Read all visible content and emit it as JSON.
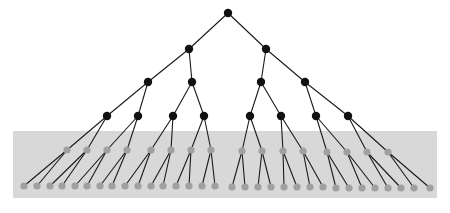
{
  "figure": {
    "type": "diagram",
    "width": 450,
    "height": 213,
    "background_color": "#ffffff"
  },
  "style": {
    "internal_node_color": "#111111",
    "leaf_node_color": "#a0a0a0",
    "edge_color": "#1a1a1a",
    "band_color": "#d8d8d8",
    "node_radius_internal": 4.2,
    "node_radius_leaf": 3.6,
    "edge_width": 1.1
  },
  "band": {
    "label": "highlight-band",
    "x": 13,
    "y": 131,
    "width": 424,
    "height": 67,
    "color": "#d8d8d8"
  },
  "tree": {
    "levels": 6,
    "branching_factor": 2,
    "level_counts": [
      1,
      2,
      4,
      8,
      16,
      32
    ],
    "level_y": [
      13,
      49,
      82,
      116,
      151,
      186
    ],
    "level_node_kind": [
      "internal",
      "internal",
      "internal",
      "internal",
      "leaf",
      "leaf"
    ],
    "nodes": [
      {
        "id": "n0-0",
        "level": 0,
        "index": 0,
        "x": 228,
        "y": 13,
        "kind": "internal",
        "parent": null
      },
      {
        "id": "n1-0",
        "level": 1,
        "index": 0,
        "x": 189,
        "y": 49,
        "kind": "internal",
        "parent": "n0-0"
      },
      {
        "id": "n1-1",
        "level": 1,
        "index": 1,
        "x": 266,
        "y": 49,
        "kind": "internal",
        "parent": "n0-0"
      },
      {
        "id": "n2-0",
        "level": 2,
        "index": 0,
        "x": 148,
        "y": 82,
        "kind": "internal",
        "parent": "n1-0"
      },
      {
        "id": "n2-1",
        "level": 2,
        "index": 1,
        "x": 192,
        "y": 82,
        "kind": "internal",
        "parent": "n1-0"
      },
      {
        "id": "n2-2",
        "level": 2,
        "index": 2,
        "x": 261,
        "y": 82,
        "kind": "internal",
        "parent": "n1-1"
      },
      {
        "id": "n2-3",
        "level": 2,
        "index": 3,
        "x": 305,
        "y": 82,
        "kind": "internal",
        "parent": "n1-1"
      },
      {
        "id": "n3-0",
        "level": 3,
        "index": 0,
        "x": 107,
        "y": 116,
        "kind": "internal",
        "parent": "n2-0"
      },
      {
        "id": "n3-1",
        "level": 3,
        "index": 1,
        "x": 138,
        "y": 116,
        "kind": "internal",
        "parent": "n2-0"
      },
      {
        "id": "n3-2",
        "level": 3,
        "index": 2,
        "x": 173,
        "y": 116,
        "kind": "internal",
        "parent": "n2-1"
      },
      {
        "id": "n3-3",
        "level": 3,
        "index": 3,
        "x": 204,
        "y": 116,
        "kind": "internal",
        "parent": "n2-1"
      },
      {
        "id": "n3-4",
        "level": 3,
        "index": 4,
        "x": 250,
        "y": 116,
        "kind": "internal",
        "parent": "n2-2"
      },
      {
        "id": "n3-5",
        "level": 3,
        "index": 5,
        "x": 281,
        "y": 116,
        "kind": "internal",
        "parent": "n2-2"
      },
      {
        "id": "n3-6",
        "level": 3,
        "index": 6,
        "x": 316,
        "y": 116,
        "kind": "internal",
        "parent": "n2-3"
      },
      {
        "id": "n3-7",
        "level": 3,
        "index": 7,
        "x": 348,
        "y": 116,
        "kind": "internal",
        "parent": "n2-3"
      },
      {
        "id": "n4-0",
        "level": 4,
        "index": 0,
        "x": 67,
        "y": 150,
        "kind": "leaf",
        "parent": "n3-0"
      },
      {
        "id": "n4-1",
        "level": 4,
        "index": 1,
        "x": 87,
        "y": 150,
        "kind": "leaf",
        "parent": "n3-0"
      },
      {
        "id": "n4-2",
        "level": 4,
        "index": 2,
        "x": 107,
        "y": 150,
        "kind": "leaf",
        "parent": "n3-1"
      },
      {
        "id": "n4-3",
        "level": 4,
        "index": 3,
        "x": 127,
        "y": 150,
        "kind": "leaf",
        "parent": "n3-1"
      },
      {
        "id": "n4-4",
        "level": 4,
        "index": 4,
        "x": 151,
        "y": 150,
        "kind": "leaf",
        "parent": "n3-2"
      },
      {
        "id": "n4-5",
        "level": 4,
        "index": 5,
        "x": 171,
        "y": 150,
        "kind": "leaf",
        "parent": "n3-2"
      },
      {
        "id": "n4-6",
        "level": 4,
        "index": 6,
        "x": 191,
        "y": 150,
        "kind": "leaf",
        "parent": "n3-3"
      },
      {
        "id": "n4-7",
        "level": 4,
        "index": 7,
        "x": 211,
        "y": 150,
        "kind": "leaf",
        "parent": "n3-3"
      },
      {
        "id": "n4-8",
        "level": 4,
        "index": 8,
        "x": 242,
        "y": 151,
        "kind": "leaf",
        "parent": "n3-4"
      },
      {
        "id": "n4-9",
        "level": 4,
        "index": 9,
        "x": 262,
        "y": 151,
        "kind": "leaf",
        "parent": "n3-4"
      },
      {
        "id": "n4-10",
        "level": 4,
        "index": 10,
        "x": 283,
        "y": 151,
        "kind": "leaf",
        "parent": "n3-5"
      },
      {
        "id": "n4-11",
        "level": 4,
        "index": 11,
        "x": 303,
        "y": 151,
        "kind": "leaf",
        "parent": "n3-5"
      },
      {
        "id": "n4-12",
        "level": 4,
        "index": 12,
        "x": 327,
        "y": 152,
        "kind": "leaf",
        "parent": "n3-6"
      },
      {
        "id": "n4-13",
        "level": 4,
        "index": 13,
        "x": 347,
        "y": 152,
        "kind": "leaf",
        "parent": "n3-6"
      },
      {
        "id": "n4-14",
        "level": 4,
        "index": 14,
        "x": 367,
        "y": 152,
        "kind": "leaf",
        "parent": "n3-7"
      },
      {
        "id": "n4-15",
        "level": 4,
        "index": 15,
        "x": 388,
        "y": 152,
        "kind": "leaf",
        "parent": "n3-7"
      },
      {
        "id": "n5-0",
        "level": 5,
        "index": 0,
        "x": 24,
        "y": 186,
        "kind": "leaf",
        "parent": "n4-0"
      },
      {
        "id": "n5-1",
        "level": 5,
        "index": 1,
        "x": 37,
        "y": 186,
        "kind": "leaf",
        "parent": "n4-0"
      },
      {
        "id": "n5-2",
        "level": 5,
        "index": 2,
        "x": 50,
        "y": 186,
        "kind": "leaf",
        "parent": "n4-1"
      },
      {
        "id": "n5-3",
        "level": 5,
        "index": 3,
        "x": 62,
        "y": 186,
        "kind": "leaf",
        "parent": "n4-1"
      },
      {
        "id": "n5-4",
        "level": 5,
        "index": 4,
        "x": 75,
        "y": 186,
        "kind": "leaf",
        "parent": "n4-2"
      },
      {
        "id": "n5-5",
        "level": 5,
        "index": 5,
        "x": 87,
        "y": 186,
        "kind": "leaf",
        "parent": "n4-2"
      },
      {
        "id": "n5-6",
        "level": 5,
        "index": 6,
        "x": 100,
        "y": 186,
        "kind": "leaf",
        "parent": "n4-3"
      },
      {
        "id": "n5-7",
        "level": 5,
        "index": 7,
        "x": 112,
        "y": 186,
        "kind": "leaf",
        "parent": "n4-3"
      },
      {
        "id": "n5-8",
        "level": 5,
        "index": 8,
        "x": 125,
        "y": 186,
        "kind": "leaf",
        "parent": "n4-4"
      },
      {
        "id": "n5-9",
        "level": 5,
        "index": 9,
        "x": 138,
        "y": 186,
        "kind": "leaf",
        "parent": "n4-4"
      },
      {
        "id": "n5-10",
        "level": 5,
        "index": 10,
        "x": 151,
        "y": 186,
        "kind": "leaf",
        "parent": "n4-5"
      },
      {
        "id": "n5-11",
        "level": 5,
        "index": 11,
        "x": 163,
        "y": 186,
        "kind": "leaf",
        "parent": "n4-5"
      },
      {
        "id": "n5-12",
        "level": 5,
        "index": 12,
        "x": 176,
        "y": 186,
        "kind": "leaf",
        "parent": "n4-6"
      },
      {
        "id": "n5-13",
        "level": 5,
        "index": 13,
        "x": 189,
        "y": 186,
        "kind": "leaf",
        "parent": "n4-6"
      },
      {
        "id": "n5-14",
        "level": 5,
        "index": 14,
        "x": 202,
        "y": 186,
        "kind": "leaf",
        "parent": "n4-7"
      },
      {
        "id": "n5-15",
        "level": 5,
        "index": 15,
        "x": 215,
        "y": 186,
        "kind": "leaf",
        "parent": "n4-7"
      },
      {
        "id": "n5-16",
        "level": 5,
        "index": 16,
        "x": 232,
        "y": 187,
        "kind": "leaf",
        "parent": "n4-8"
      },
      {
        "id": "n5-17",
        "level": 5,
        "index": 17,
        "x": 245,
        "y": 187,
        "kind": "leaf",
        "parent": "n4-8"
      },
      {
        "id": "n5-18",
        "level": 5,
        "index": 18,
        "x": 258,
        "y": 187,
        "kind": "leaf",
        "parent": "n4-9"
      },
      {
        "id": "n5-19",
        "level": 5,
        "index": 19,
        "x": 271,
        "y": 187,
        "kind": "leaf",
        "parent": "n4-9"
      },
      {
        "id": "n5-20",
        "level": 5,
        "index": 20,
        "x": 284,
        "y": 187,
        "kind": "leaf",
        "parent": "n4-10"
      },
      {
        "id": "n5-21",
        "level": 5,
        "index": 21,
        "x": 297,
        "y": 187,
        "kind": "leaf",
        "parent": "n4-10"
      },
      {
        "id": "n5-22",
        "level": 5,
        "index": 22,
        "x": 310,
        "y": 187,
        "kind": "leaf",
        "parent": "n4-11"
      },
      {
        "id": "n5-23",
        "level": 5,
        "index": 23,
        "x": 323,
        "y": 187,
        "kind": "leaf",
        "parent": "n4-11"
      },
      {
        "id": "n5-24",
        "level": 5,
        "index": 24,
        "x": 336,
        "y": 188,
        "kind": "leaf",
        "parent": "n4-12"
      },
      {
        "id": "n5-25",
        "level": 5,
        "index": 25,
        "x": 349,
        "y": 188,
        "kind": "leaf",
        "parent": "n4-12"
      },
      {
        "id": "n5-26",
        "level": 5,
        "index": 26,
        "x": 362,
        "y": 188,
        "kind": "leaf",
        "parent": "n4-13"
      },
      {
        "id": "n5-27",
        "level": 5,
        "index": 27,
        "x": 375,
        "y": 188,
        "kind": "leaf",
        "parent": "n4-13"
      },
      {
        "id": "n5-28",
        "level": 5,
        "index": 28,
        "x": 388,
        "y": 188,
        "kind": "leaf",
        "parent": "n4-14"
      },
      {
        "id": "n5-29",
        "level": 5,
        "index": 29,
        "x": 401,
        "y": 188,
        "kind": "leaf",
        "parent": "n4-14"
      },
      {
        "id": "n5-30",
        "level": 5,
        "index": 30,
        "x": 414,
        "y": 188,
        "kind": "leaf",
        "parent": "n4-15"
      },
      {
        "id": "n5-31",
        "level": 5,
        "index": 31,
        "x": 430,
        "y": 188,
        "kind": "leaf",
        "parent": "n4-15"
      }
    ]
  }
}
